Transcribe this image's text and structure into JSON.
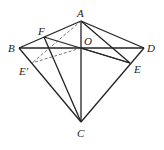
{
  "figure": {
    "type": "geometry",
    "points": {
      "A": {
        "label": "A"
      },
      "B": {
        "label": "B"
      },
      "C": {
        "label": "C"
      },
      "D": {
        "label": "D"
      },
      "O": {
        "label": "O"
      },
      "E": {
        "label": "E"
      },
      "E'": {
        "label": "E'"
      },
      "F": {
        "label": "F"
      }
    },
    "solid_segments": [
      [
        "A",
        "B"
      ],
      [
        "A",
        "D"
      ],
      [
        "B",
        "D"
      ],
      [
        "A",
        "C"
      ],
      [
        "B",
        "C"
      ],
      [
        "D",
        "C"
      ],
      [
        "A",
        "E"
      ],
      [
        "F",
        "E"
      ],
      [
        "F",
        "C"
      ],
      [
        "O",
        "E"
      ]
    ],
    "dashed_segments": [
      [
        "A",
        "E'"
      ],
      [
        "O",
        "E'"
      ]
    ]
  }
}
